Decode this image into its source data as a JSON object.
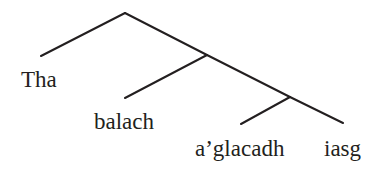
{
  "diagram": {
    "type": "syntax-tree",
    "line_color": "#231f20",
    "text_color": "#231f20",
    "background": "#ffffff",
    "nodes": {
      "root": {
        "x": 125,
        "y": 13
      },
      "n1": {
        "x": 207,
        "y": 55
      },
      "n2": {
        "x": 290,
        "y": 97
      }
    },
    "edges": [
      {
        "from": "root",
        "to": "leaf-tha",
        "x1": 125,
        "y1": 13,
        "x2": 41,
        "y2": 56
      },
      {
        "from": "root",
        "to": "n1",
        "x1": 125,
        "y1": 13,
        "x2": 207,
        "y2": 55
      },
      {
        "from": "n1",
        "to": "leaf-balach",
        "x1": 207,
        "y1": 55,
        "x2": 125,
        "y2": 98
      },
      {
        "from": "n1",
        "to": "n2",
        "x1": 207,
        "y1": 55,
        "x2": 290,
        "y2": 97
      },
      {
        "from": "n2",
        "to": "leaf-aglacadh",
        "x1": 290,
        "y1": 97,
        "x2": 241,
        "y2": 124
      },
      {
        "from": "n2",
        "to": "leaf-iasg",
        "x1": 290,
        "y1": 97,
        "x2": 343,
        "y2": 123
      }
    ],
    "leaves": [
      {
        "id": "leaf-tha",
        "label": "Tha"
      },
      {
        "id": "leaf-balach",
        "label": "balach"
      },
      {
        "id": "leaf-aglacadh",
        "label": "a’glacadh"
      },
      {
        "id": "leaf-iasg",
        "label": "iasg"
      }
    ]
  }
}
